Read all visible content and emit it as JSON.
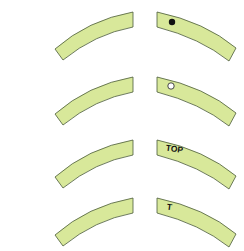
{
  "diagram": {
    "title": "",
    "fill_color": "#d8e89a",
    "stroke_color": "#4a5a3a",
    "rows": [
      {
        "marker_type": "filled-dot",
        "label": ""
      },
      {
        "marker_type": "hollow-dot",
        "label": ""
      },
      {
        "marker_type": "text",
        "label": "TOP"
      },
      {
        "marker_type": "text",
        "label": "T"
      }
    ]
  }
}
